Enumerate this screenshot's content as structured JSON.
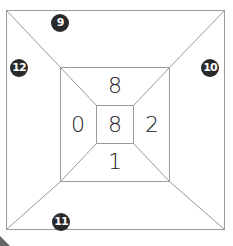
{
  "figure": {
    "type": "nested-squares-puzzle",
    "line_color": "#9a9a9a",
    "outer_badges": [
      {
        "id": "top",
        "label": "9"
      },
      {
        "id": "right",
        "label": "10"
      },
      {
        "id": "bottom",
        "label": "11"
      },
      {
        "id": "left",
        "label": "12"
      }
    ],
    "middle_ring_numbers": {
      "top": "8",
      "left": "0",
      "right": "2",
      "bottom": "1"
    },
    "center_number": "8",
    "badge_color": "#2a2a2a"
  }
}
